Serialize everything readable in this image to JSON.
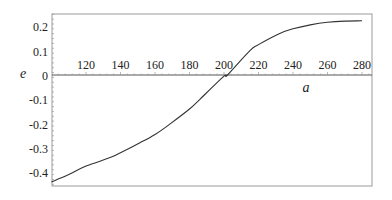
{
  "chart_data": {
    "type": "line",
    "title": "",
    "xlabel": "a",
    "ylabel": "e",
    "xlim": [
      100,
      286
    ],
    "ylim": [
      -0.46,
      0.25
    ],
    "x_ticks": [
      120,
      140,
      160,
      180,
      200,
      220,
      240,
      260,
      280
    ],
    "y_ticks": [
      0.2,
      0.1,
      0,
      -0.1,
      -0.2,
      -0.3,
      -0.4
    ],
    "y_tick_labels": [
      "0.2",
      "0.1",
      "0",
      "-0.1",
      "-0.2",
      "-0.3",
      "-0.4"
    ],
    "grid": false,
    "legend": null,
    "series": [
      {
        "name": "e(a)",
        "color": "#333333",
        "x": [
          100,
          110,
          120,
          134,
          140,
          151,
          160,
          169,
          180,
          186,
          200,
          202,
          215,
          220,
          232,
          240,
          250,
          260,
          270,
          280
        ],
        "y": [
          -0.44,
          -0.41,
          -0.375,
          -0.34,
          -0.32,
          -0.28,
          -0.245,
          -0.2,
          -0.14,
          -0.1,
          -0.005,
          0.0,
          0.1,
          0.125,
          0.17,
          0.19,
          0.206,
          0.217,
          0.222,
          0.223
        ]
      }
    ]
  },
  "colors": {
    "frame": "#9a9a9a",
    "axis": "#555555",
    "curve": "#333333",
    "text": "#222222"
  }
}
